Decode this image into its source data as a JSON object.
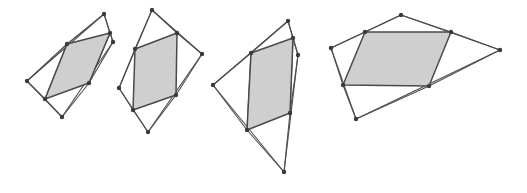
{
  "figure": {
    "width": 527,
    "height": 193,
    "background_color": "#ffffff",
    "outline_color": "#4d4d4d",
    "shaded_fill_color": "#cfcfcf",
    "shaded_stroke_color": "#4a4a4a",
    "vertex_color": "#3a3a3a",
    "vertex_radius": 2.2
  },
  "panels": [
    {
      "id": "panel-1",
      "label": "figure-1",
      "outer_quad": [
        [
          104,
          14
        ],
        [
          113,
          42
        ],
        [
          62,
          117
        ],
        [
          27,
          81
        ]
      ],
      "inner_quad": [
        [
          67,
          44
        ],
        [
          110,
          33
        ],
        [
          89,
          83
        ],
        [
          45,
          99
        ]
      ],
      "connectors": [
        [
          [
            104,
            14
          ],
          [
            110,
            33
          ]
        ],
        [
          [
            110,
            33
          ],
          [
            113,
            42
          ]
        ],
        [
          [
            104,
            14
          ],
          [
            67,
            44
          ]
        ],
        [
          [
            110,
            33
          ],
          [
            89,
            83
          ]
        ],
        [
          [
            113,
            42
          ],
          [
            89,
            83
          ]
        ],
        [
          [
            27,
            81
          ],
          [
            45,
            99
          ]
        ],
        [
          [
            45,
            99
          ],
          [
            62,
            117
          ]
        ],
        [
          [
            67,
            44
          ],
          [
            45,
            99
          ]
        ],
        [
          [
            89,
            83
          ],
          [
            62,
            117
          ]
        ],
        [
          [
            27,
            81
          ],
          [
            67,
            44
          ]
        ]
      ],
      "extra_points": []
    },
    {
      "id": "panel-2",
      "label": "figure-2",
      "outer_quad": [
        [
          152,
          10
        ],
        [
          202,
          54
        ],
        [
          148,
          132
        ],
        [
          119,
          88
        ]
      ],
      "inner_quad": [
        [
          135,
          49
        ],
        [
          177,
          33
        ],
        [
          176,
          95
        ],
        [
          133,
          110
        ]
      ],
      "connectors": [
        [
          [
            152,
            10
          ],
          [
            135,
            49
          ]
        ],
        [
          [
            152,
            10
          ],
          [
            177,
            33
          ]
        ],
        [
          [
            177,
            33
          ],
          [
            202,
            54
          ]
        ],
        [
          [
            202,
            54
          ],
          [
            176,
            95
          ]
        ],
        [
          [
            176,
            95
          ],
          [
            148,
            132
          ]
        ],
        [
          [
            148,
            132
          ],
          [
            133,
            110
          ]
        ],
        [
          [
            133,
            110
          ],
          [
            119,
            88
          ]
        ],
        [
          [
            119,
            88
          ],
          [
            135,
            49
          ]
        ]
      ],
      "extra_points": []
    },
    {
      "id": "panel-3",
      "label": "figure-3",
      "outer_quad": [
        [
          288,
          21
        ],
        [
          298,
          55
        ],
        [
          284,
          172
        ],
        [
          213,
          85
        ]
      ],
      "inner_quad": [
        [
          251,
          53
        ],
        [
          293,
          38
        ],
        [
          290,
          113
        ],
        [
          247,
          130
        ]
      ],
      "connectors": [
        [
          [
            288,
            21
          ],
          [
            293,
            38
          ]
        ],
        [
          [
            293,
            38
          ],
          [
            298,
            55
          ]
        ],
        [
          [
            288,
            21
          ],
          [
            251,
            53
          ]
        ],
        [
          [
            293,
            38
          ],
          [
            290,
            113
          ]
        ],
        [
          [
            298,
            55
          ],
          [
            290,
            113
          ]
        ],
        [
          [
            290,
            113
          ],
          [
            284,
            172
          ]
        ],
        [
          [
            247,
            130
          ],
          [
            284,
            172
          ]
        ],
        [
          [
            251,
            53
          ],
          [
            247,
            130
          ]
        ],
        [
          [
            213,
            85
          ],
          [
            251,
            53
          ]
        ],
        [
          [
            213,
            85
          ],
          [
            247,
            130
          ]
        ]
      ],
      "extra_points": []
    },
    {
      "id": "panel-4",
      "label": "figure-4",
      "outer_quad": [
        [
          401,
          15
        ],
        [
          500,
          50
        ],
        [
          356,
          119
        ],
        [
          331,
          48
        ]
      ],
      "inner_quad": [
        [
          365,
          32
        ],
        [
          451,
          32
        ],
        [
          429,
          86
        ],
        [
          343,
          85
        ]
      ],
      "connectors": [
        [
          [
            401,
            15
          ],
          [
            365,
            32
          ]
        ],
        [
          [
            401,
            15
          ],
          [
            451,
            32
          ]
        ],
        [
          [
            451,
            32
          ],
          [
            500,
            50
          ]
        ],
        [
          [
            500,
            50
          ],
          [
            429,
            86
          ]
        ],
        [
          [
            429,
            86
          ],
          [
            356,
            119
          ]
        ],
        [
          [
            356,
            119
          ],
          [
            343,
            85
          ]
        ],
        [
          [
            343,
            85
          ],
          [
            331,
            48
          ]
        ],
        [
          [
            331,
            48
          ],
          [
            365,
            32
          ]
        ]
      ],
      "extra_points": []
    }
  ]
}
